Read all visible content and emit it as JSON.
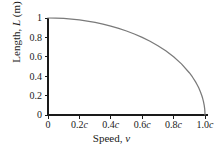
{
  "chart_data": {
    "type": "line",
    "title": "",
    "xlabel": "Speed, v",
    "xlabel_plain": "Speed,",
    "xlabel_italic": "v",
    "ylabel": "Length, L (m)",
    "ylabel_pre": "Length,",
    "ylabel_italic": "L",
    "ylabel_post": "(m)",
    "xlim": [
      0,
      1
    ],
    "ylim": [
      0,
      1
    ],
    "grid": false,
    "legend": false,
    "x_tick_labels": [
      "0",
      "0.2c",
      "0.4c",
      "0.6c",
      "0.8c",
      "1.0c"
    ],
    "x_tick_values": [
      0,
      0.2,
      0.4,
      0.6,
      0.8,
      1.0
    ],
    "x_tick_unit": "c",
    "y_tick_labels": [
      "0",
      "0.2",
      "0.4",
      "0.6",
      "0.8",
      "1"
    ],
    "y_tick_values": [
      0,
      0.2,
      0.4,
      0.6,
      0.8,
      1.0
    ],
    "series": [
      {
        "name": "Contracted length",
        "color": "#7a7a7a",
        "x": [
          0,
          0.05,
          0.1,
          0.15,
          0.2,
          0.25,
          0.3,
          0.35,
          0.4,
          0.45,
          0.5,
          0.55,
          0.6,
          0.65,
          0.7,
          0.75,
          0.8,
          0.85,
          0.9,
          0.92,
          0.94,
          0.95,
          0.96,
          0.97,
          0.98,
          0.985,
          0.99,
          0.995,
          0.998,
          0.9995,
          1
        ],
        "y": [
          1,
          0.9987,
          0.995,
          0.9887,
          0.9798,
          0.9682,
          0.9539,
          0.9368,
          0.9165,
          0.893,
          0.866,
          0.8352,
          0.8,
          0.76,
          0.7141,
          0.6614,
          0.6,
          0.5268,
          0.4359,
          0.3919,
          0.3412,
          0.3122,
          0.28,
          0.2431,
          0.199,
          0.1723,
          0.1411,
          0.0999,
          0.0632,
          0.0316,
          0
        ]
      }
    ]
  },
  "axes": {
    "axis_color": "#1a1a1a",
    "curve_color": "#7a7a7a",
    "background": "#ffffff"
  }
}
